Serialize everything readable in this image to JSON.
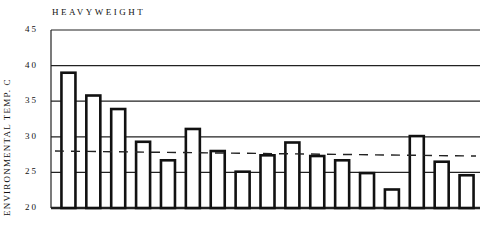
{
  "chart_data": {
    "type": "bar",
    "title": "HEAVYWEIGHT",
    "xlabel": "",
    "ylabel": "ENVIRONMENTAL TEMP.  C",
    "ylim": [
      20,
      45
    ],
    "yticks": [
      "45",
      "40",
      "35",
      "30",
      "25",
      "20"
    ],
    "grid": true,
    "legend": null,
    "categories": [
      "1",
      "2",
      "3",
      "4",
      "5",
      "6",
      "7",
      "8",
      "9",
      "10",
      "11",
      "12",
      "13",
      "14",
      "15",
      "16",
      "17"
    ],
    "values": [
      39.0,
      35.8,
      33.9,
      29.3,
      26.7,
      31.1,
      28.0,
      25.1,
      27.4,
      29.2,
      27.3,
      26.7,
      24.9,
      22.6,
      30.1,
      26.5,
      24.6
    ],
    "reference_line": {
      "style": "dashed",
      "start": 28.0,
      "end": 27.3
    }
  }
}
